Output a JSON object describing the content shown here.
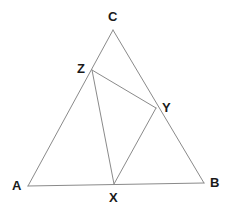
{
  "figure": {
    "type": "geometry-diagram",
    "background_color": "#ffffff",
    "line_color": "#8a8a8a",
    "label_color": "#1a1a1a",
    "line_width": 1
  },
  "points": {
    "A": {
      "label": "A",
      "x": 28,
      "y": 186,
      "label_x": 12,
      "label_y": 179,
      "on": "vertex"
    },
    "B": {
      "label": "B",
      "x": 204,
      "y": 183,
      "label_x": 210,
      "label_y": 176,
      "on": "vertex"
    },
    "C": {
      "label": "C",
      "x": 113,
      "y": 30,
      "label_x": 108,
      "label_y": 10,
      "on": "vertex"
    },
    "X": {
      "label": "X",
      "x": 114,
      "y": 184,
      "label_x": 109,
      "label_y": 191,
      "on": "side-AB"
    },
    "Y": {
      "label": "Y",
      "x": 156,
      "y": 108,
      "label_x": 162,
      "label_y": 101,
      "on": "side-CB"
    },
    "Z": {
      "label": "Z",
      "x": 92,
      "y": 70,
      "label_x": 77,
      "label_y": 62,
      "on": "side-AC"
    }
  },
  "segments": [
    {
      "name": "side-AB",
      "from": "A",
      "to": "B",
      "x1": 28,
      "y1": 186,
      "x2": 204,
      "y2": 183
    },
    {
      "name": "side-AC",
      "from": "A",
      "to": "C",
      "x1": 28,
      "y1": 186,
      "x2": 113,
      "y2": 30
    },
    {
      "name": "side-CB",
      "from": "C",
      "to": "B",
      "x1": 113,
      "y1": 30,
      "x2": 204,
      "y2": 183
    },
    {
      "name": "cevian-ZY",
      "from": "Z",
      "to": "Y",
      "x1": 92,
      "y1": 70,
      "x2": 156,
      "y2": 108
    },
    {
      "name": "cevian-ZX",
      "from": "Z",
      "to": "X",
      "x1": 92,
      "y1": 70,
      "x2": 114,
      "y2": 184
    },
    {
      "name": "cevian-YX",
      "from": "Y",
      "to": "X",
      "x1": 156,
      "y1": 108,
      "x2": 114,
      "y2": 184
    }
  ]
}
